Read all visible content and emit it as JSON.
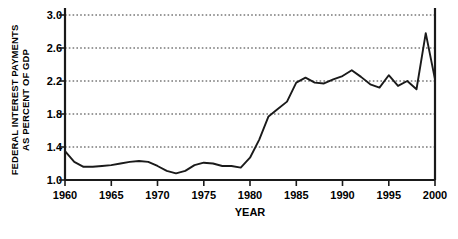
{
  "chart_data": {
    "type": "line",
    "title": "",
    "xlabel": "YEAR",
    "ylabel": "FEDERAL INTEREST PAYMENTS AS PERCENT OF GDP",
    "ylabel_lines": [
      "FEDERAL INTEREST PAYMENTS",
      "AS PERCENT OF GDP"
    ],
    "xlim": [
      1960,
      2000
    ],
    "ylim": [
      1.0,
      3.0
    ],
    "grid": "horizontal-dotted",
    "legend": "none",
    "line_color": "#1a1a1a",
    "ytick_labels": [
      "3.0",
      "2.6",
      "2.2",
      "1.8",
      "1.4",
      "1.0"
    ],
    "ytick_values": [
      3.0,
      2.6,
      2.2,
      1.8,
      1.4,
      1.0
    ],
    "xtick_labels": [
      "1960",
      "1965",
      "1970",
      "1975",
      "1980",
      "1985",
      "1990",
      "1995",
      "2000"
    ],
    "xtick_values": [
      1960,
      1965,
      1970,
      1975,
      1980,
      1985,
      1990,
      1995,
      2000
    ],
    "x": [
      1960,
      1961,
      1962,
      1963,
      1964,
      1965,
      1966,
      1967,
      1968,
      1969,
      1970,
      1971,
      1972,
      1973,
      1974,
      1975,
      1976,
      1977,
      1978,
      1979,
      1980,
      1981,
      1982,
      1983,
      1984,
      1985,
      1986,
      1987,
      1988,
      1989,
      1990,
      1991,
      1992,
      1993,
      1994,
      1995,
      1996,
      1997,
      1998,
      1999,
      2000
    ],
    "values": [
      1.35,
      1.22,
      1.16,
      1.16,
      1.17,
      1.18,
      1.2,
      1.22,
      1.23,
      1.22,
      1.17,
      1.11,
      1.08,
      1.11,
      1.18,
      1.21,
      1.2,
      1.17,
      1.17,
      1.15,
      1.27,
      1.49,
      1.77,
      1.86,
      1.95,
      2.18,
      2.24,
      2.18,
      2.17,
      2.22,
      2.26,
      2.33,
      2.25,
      2.16,
      2.12,
      2.27,
      2.14,
      2.2,
      2.1,
      2.78,
      2.22
    ],
    "series": [
      {
        "name": "Federal interest payments as percent of GDP",
        "values": [
          1.35,
          1.22,
          1.16,
          1.16,
          1.17,
          1.18,
          1.2,
          1.22,
          1.23,
          1.22,
          1.17,
          1.11,
          1.08,
          1.11,
          1.18,
          1.21,
          1.2,
          1.17,
          1.17,
          1.15,
          1.27,
          1.49,
          1.77,
          1.86,
          1.95,
          2.18,
          2.24,
          2.18,
          2.17,
          2.22,
          2.26,
          2.33,
          2.25,
          2.16,
          2.12,
          2.27,
          2.14,
          2.2,
          2.1,
          2.78,
          2.22
        ]
      }
    ]
  }
}
